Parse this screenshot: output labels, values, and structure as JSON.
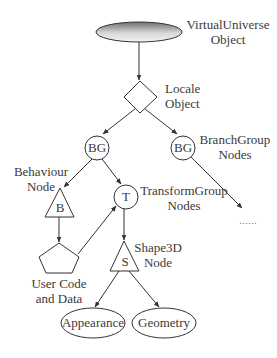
{
  "diagram": {
    "type": "scene-graph",
    "nodes": {
      "virtual_universe": {
        "label": "VirtualUniverse",
        "label2": "Object"
      },
      "locale": {
        "label": "Locale",
        "label2": "Object"
      },
      "bg_left": {
        "text": "BG"
      },
      "bg_right": {
        "text": "BG",
        "label": "BranchGroup",
        "label2": "Nodes"
      },
      "behaviour": {
        "text": "B",
        "label": "Behaviour",
        "label2": "Node"
      },
      "transform": {
        "text": "T",
        "label": "TransformGroup",
        "label2": "Nodes"
      },
      "user_code": {
        "label": "User Code",
        "label2": "and Data"
      },
      "shape3d": {
        "text": "S",
        "label": "Shape3D",
        "label2": "Node"
      },
      "appearance": {
        "text": "Appearance"
      },
      "geometry": {
        "text": "Geometry"
      },
      "continuation": {
        "text": "……"
      }
    },
    "edges": [
      [
        "virtual_universe",
        "locale"
      ],
      [
        "locale",
        "bg_left"
      ],
      [
        "locale",
        "bg_right"
      ],
      [
        "bg_left",
        "behaviour"
      ],
      [
        "bg_left",
        "transform"
      ],
      [
        "bg_right",
        "continuation"
      ],
      [
        "behaviour",
        "user_code"
      ],
      [
        "user_code",
        "transform"
      ],
      [
        "transform",
        "shape3d"
      ],
      [
        "shape3d",
        "appearance"
      ],
      [
        "shape3d",
        "geometry"
      ]
    ],
    "colors": {
      "stroke": "#333333",
      "text": "#3a3a3a",
      "gradient_dark": "#6e6e6e",
      "gradient_light": "#f4f4f4"
    }
  }
}
